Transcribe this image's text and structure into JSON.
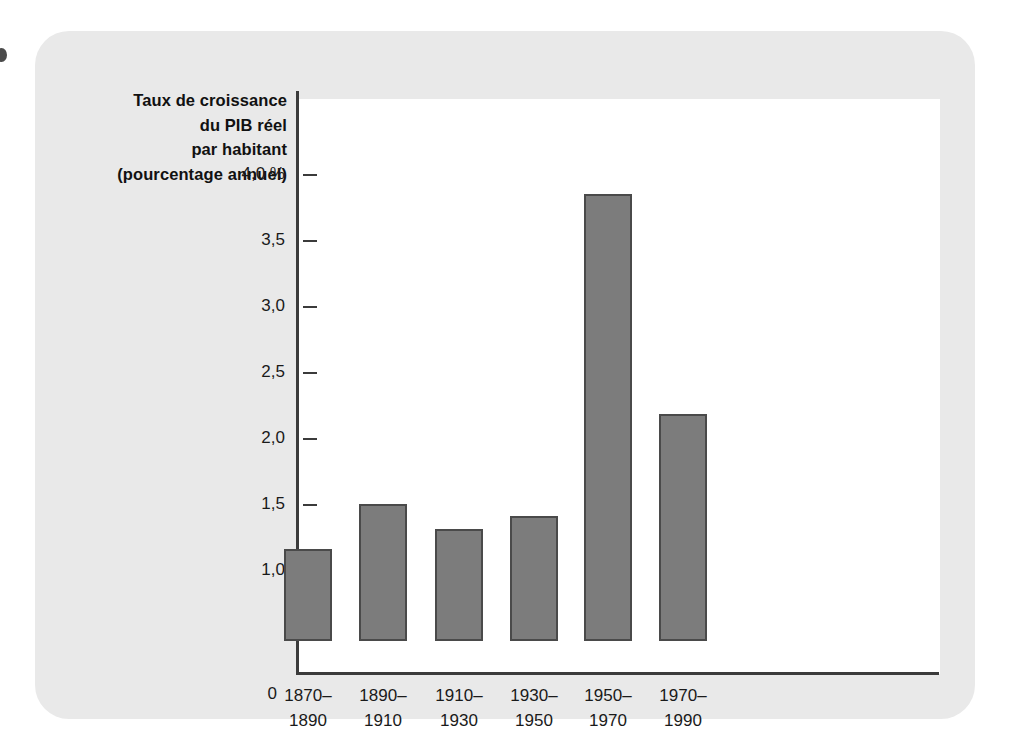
{
  "figure": {
    "background_color": "#e9e9e9",
    "plot_background_color": "#ffffff",
    "bar_color": "#7c7c7c",
    "bar_border_color": "#4a4a4a",
    "axis_color": "#3b3b3b",
    "zero_label": "0"
  },
  "chart_data": {
    "type": "bar",
    "title": "Taux de croissance\ndu PIB réel\npar habitant\n(pourcentage annuel)",
    "title_lines": [
      "Taux de croissance",
      "du PIB réel",
      "par habitant",
      "(pourcentage annuel)"
    ],
    "xlabel": "",
    "ylabel": "Taux de croissance du PIB réel par habitant (pourcentage annuel)",
    "categories": [
      "1870–\n1890",
      "1890–\n1910",
      "1910–\n1930",
      "1930–\n1950",
      "1950–\n1970",
      "1970–\n1990"
    ],
    "category_lines": [
      [
        "1870–",
        "1890"
      ],
      [
        "1890–",
        "1910"
      ],
      [
        "1910–",
        "1930"
      ],
      [
        "1930–",
        "1950"
      ],
      [
        "1950–",
        "1970"
      ],
      [
        "1970–",
        "1990"
      ]
    ],
    "values": [
      1.17,
      1.51,
      1.32,
      1.42,
      3.86,
      2.19
    ],
    "ylim": [
      0.47,
      4.4
    ],
    "ytick_values": [
      4.0,
      3.5,
      3.0,
      2.5,
      2.0,
      1.5,
      1.0
    ],
    "ytick_labels": [
      "4,0 %",
      "3,5",
      "3,0",
      "2,5",
      "2,0",
      "1,5",
      "1,0"
    ],
    "grid": false,
    "legend": false,
    "axis_origin_label": "0",
    "units": "percent"
  }
}
